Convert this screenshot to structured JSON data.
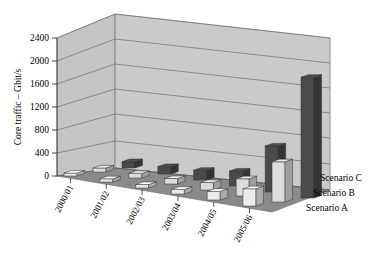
{
  "chart_data": {
    "type": "bar",
    "title": "",
    "subtitle": "",
    "xlabel": "",
    "ylabel": "Core traffic – Gbit/s",
    "ylim": [
      0,
      2400
    ],
    "yticks": [
      0,
      400,
      800,
      1200,
      1600,
      2000,
      2400
    ],
    "ytick_labels": [
      "0",
      "400",
      "800",
      "1200",
      "1600",
      "2000",
      "2400"
    ],
    "grid": true,
    "grid_orientation": "horizontal",
    "three_d": true,
    "legend_position": "right-depth-axis",
    "categories": [
      "2000/01",
      "2001/02",
      "2002/03",
      "2003/04",
      "2004/05",
      "2005/06"
    ],
    "series": [
      {
        "name": "Scenario C",
        "color": "#4a4a4a",
        "depth_position": "back",
        "values": [
          110,
          130,
          170,
          260,
          800,
          2100
        ]
      },
      {
        "name": "Scenario B",
        "color": "#dcdcdc",
        "depth_position": "middle",
        "values": [
          70,
          80,
          95,
          130,
          300,
          700
        ]
      },
      {
        "name": "Scenario A",
        "color": "#ececec",
        "depth_position": "front",
        "values": [
          50,
          55,
          60,
          80,
          150,
          300
        ]
      }
    ],
    "colors": {
      "wall_back": "#c8c8c8",
      "wall_side": "#c4c4c4",
      "floor": "#8a8a8a",
      "gridline": "#6e6e6e",
      "axis": "#3a3a3a",
      "background": "#ffffff",
      "series_c": "#4a4a4a",
      "series_b": "#dcdcdc",
      "series_a": "#ececec"
    }
  },
  "legend": {
    "entries": [
      {
        "label": "Scenario C"
      },
      {
        "label": "Scenario B"
      },
      {
        "label": "Scenario A"
      }
    ]
  },
  "axes": {
    "y_title": "Core traffic – Gbit/s",
    "y_ticks": [
      "2400",
      "2000",
      "1600",
      "1200",
      "800",
      "400",
      "0"
    ],
    "x_categories": [
      "2000/01",
      "2001/02",
      "2002/03",
      "2003/04",
      "2004/05",
      "2005/06"
    ]
  }
}
